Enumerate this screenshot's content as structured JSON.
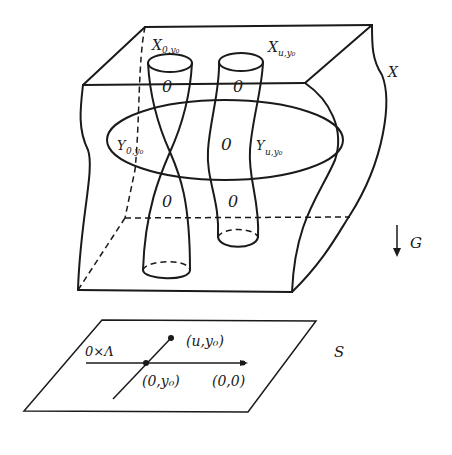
{
  "diagram": {
    "labels": {
      "X": "X",
      "X0y0_main": "X",
      "X0y0_sub": "0,y₀",
      "Xuy0_main": "X",
      "Xuy0_sub": "u,y₀",
      "Y0y0_main": "Y",
      "Y0y0_sub": "0,y₀",
      "Yuy0_main": "Y",
      "Yuy0_sub": "u,y₀",
      "G": "G",
      "S": "S",
      "zero_lambda": "0×Λ",
      "point_u_y0": "(u,y₀)",
      "point_0_y0": "(0,y₀)",
      "point_0_0": "(0,0)",
      "zero_marks": [
        "0",
        "0",
        "0",
        "0",
        "0"
      ]
    },
    "colors": {
      "stroke": "#1a1a1a",
      "background": "#ffffff"
    }
  }
}
